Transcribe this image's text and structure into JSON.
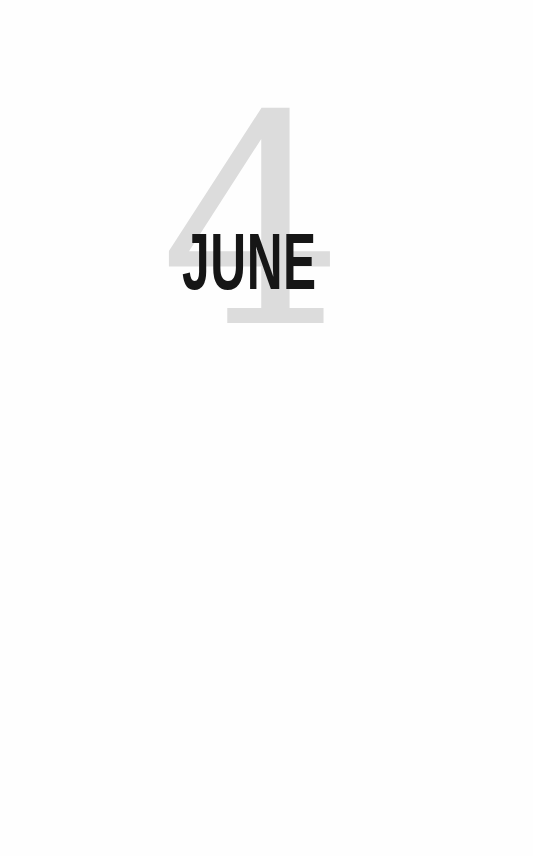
{
  "chapter": {
    "number": "4",
    "title": "JUNE",
    "number_color": "#dcdcdc",
    "title_color": "#161616"
  }
}
